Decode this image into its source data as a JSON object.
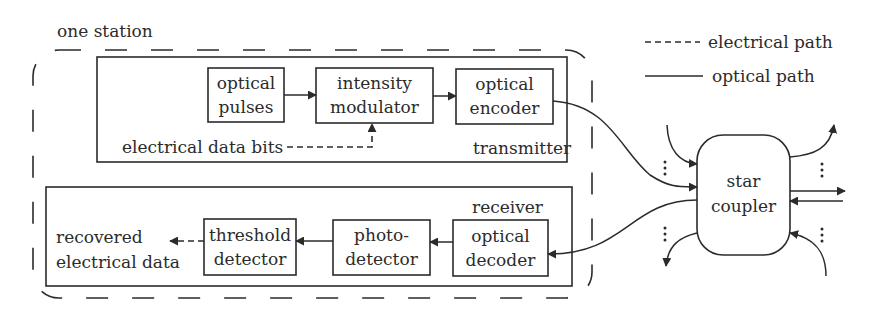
{
  "diagram": {
    "station_label": "one station",
    "legend": {
      "electrical": "electrical path",
      "optical": "optical path"
    },
    "transmitter": {
      "label": "transmitter",
      "blocks": [
        {
          "line1": "optical",
          "line2": "pulses"
        },
        {
          "line1": "intensity",
          "line2": "modulator"
        },
        {
          "line1": "optical",
          "line2": "encoder"
        }
      ],
      "input_label": "electrical data bits"
    },
    "receiver": {
      "label": "receiver",
      "blocks": [
        {
          "line1": "threshold",
          "line2": "detector"
        },
        {
          "line1": "photo-",
          "line2": "detector"
        },
        {
          "line1": "optical",
          "line2": "decoder"
        }
      ],
      "output_label_1": "recovered",
      "output_label_2": "electrical data"
    },
    "star_coupler": {
      "line1": "star",
      "line2": "coupler"
    },
    "colors": {
      "ink": "#2b2b2b",
      "background": "#ffffff"
    }
  }
}
